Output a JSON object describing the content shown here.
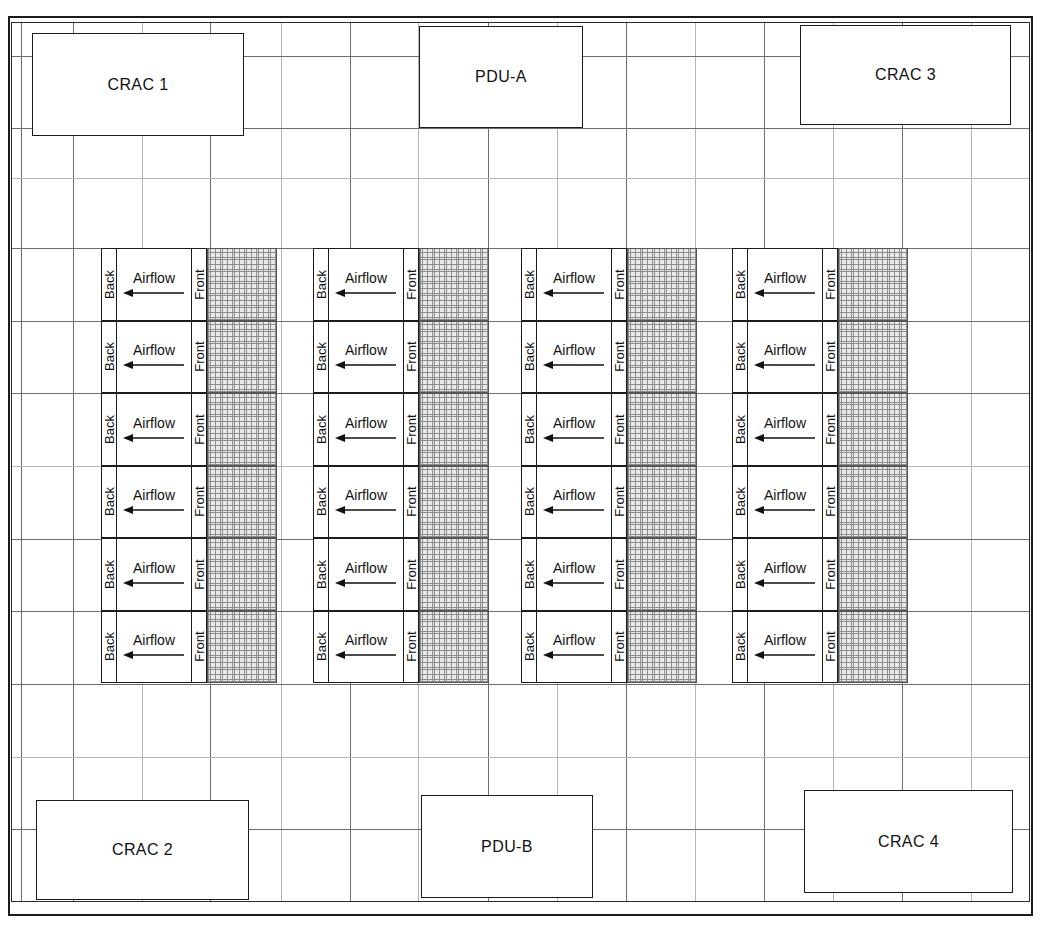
{
  "diagram": {
    "colors": {
      "wall": "#1b1b1b",
      "grid_line": "#6e6e6e",
      "grid_line_faint": "#b6b6b6",
      "hatch_fill": "#e9e9e9",
      "hatch_line": "#8d8d8d",
      "text": "#111111"
    }
  },
  "equipment": [
    {
      "id": "crac-1",
      "label": "CRAC 1",
      "type": "crac",
      "x": 32,
      "y": 33,
      "w": 212,
      "h": 103
    },
    {
      "id": "pdu-a",
      "label": "PDU-A",
      "type": "pdu",
      "x": 419,
      "y": 26,
      "w": 164,
      "h": 102
    },
    {
      "id": "crac-3",
      "label": "CRAC 3",
      "type": "crac",
      "x": 800,
      "y": 25,
      "w": 211,
      "h": 100
    },
    {
      "id": "crac-2",
      "label": "CRAC 2",
      "type": "crac",
      "x": 36,
      "y": 800,
      "w": 213,
      "h": 100
    },
    {
      "id": "pdu-b",
      "label": "PDU-B",
      "type": "pdu",
      "x": 421,
      "y": 795,
      "w": 172,
      "h": 103
    },
    {
      "id": "crac-4",
      "label": "CRAC 4",
      "type": "crac",
      "x": 804,
      "y": 790,
      "w": 209,
      "h": 103
    }
  ],
  "rack_labels": {
    "back": "Back",
    "front": "Front",
    "airflow": "Airflow",
    "arrow_direction": "left"
  },
  "rack_layout": {
    "rows": 6,
    "columns": 4,
    "row_top": 248,
    "row_height": 72.5,
    "rack_width": 106,
    "hatch_width": 70,
    "column_x": [
      101,
      313,
      521,
      732
    ]
  },
  "grid": {
    "vertical_x": [
      21,
      73,
      142,
      210,
      281,
      350,
      418,
      488,
      557,
      626,
      695,
      764,
      833,
      902,
      971
    ],
    "vertical_faint_x": [
      142,
      281,
      418,
      557,
      695,
      833,
      971
    ],
    "horizontal_y": [
      56,
      128,
      178,
      248,
      321,
      393,
      466,
      539,
      611,
      684,
      757,
      829
    ],
    "horizontal_faint_y": [
      178,
      466,
      757
    ]
  },
  "legend_notes": {
    "hatched_meaning": "perforated floor tile / cold aisle",
    "crac_meaning": "Computer Room Air Conditioner",
    "pdu_meaning": "Power Distribution Unit"
  }
}
